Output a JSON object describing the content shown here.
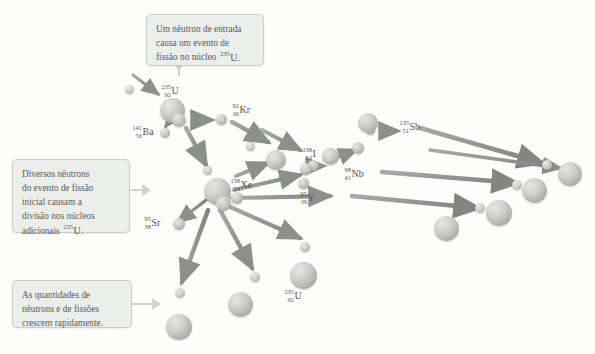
{
  "diagram": {
    "type": "nuclear-fission-chain-reaction",
    "palette": {
      "background": "#fdfdfc",
      "callout_fill": "#eceeec",
      "callout_border": "#c9cdc9",
      "text": "#5b5b57",
      "arrow": "#8d8f89",
      "sphere_light": "#e6e7e3",
      "sphere_dark": "#94968f"
    }
  },
  "callouts": [
    {
      "id": "callout-incoming-neutron",
      "lines": [
        "Um nêutron de entrada",
        "causa um evento de",
        "fissão no núcleo  235U."
      ],
      "line1": "Um nêutron de entrada",
      "line2": "causa um evento de",
      "line3_pre": "fissão no núcleo",
      "line3_iso_a": "235",
      "line3_iso_sym": "U."
    },
    {
      "id": "callout-several-neutrons",
      "lines": [
        "Diversos nêutrons",
        "do evento de fissão",
        "inicial causam a",
        "divisão nos núcleos",
        "adicionais  235U."
      ],
      "line1": "Diversos nêutrons",
      "line2": "do evento de fissão",
      "line3": "inicial causam a",
      "line4": "divisão nos núcleos",
      "line5_pre": "adicionais",
      "line5_iso_a": "235",
      "line5_iso_sym": "U."
    },
    {
      "id": "callout-rapid-growth",
      "lines": [
        "As quantidades de",
        "nêutrons e de fissões",
        "crescem rapidamente."
      ],
      "line1": "As quantidades de",
      "line2": "nêutrons e de fissões",
      "line3": "crescem rapidamente."
    }
  ],
  "isotopes": [
    {
      "id": "iso-u235-top",
      "a": "235",
      "z": "92",
      "symbol": "U"
    },
    {
      "id": "iso-kr92",
      "a": "92",
      "z": "36",
      "symbol": "Kr"
    },
    {
      "id": "iso-ba141",
      "a": "141",
      "z": "56",
      "symbol": "Ba"
    },
    {
      "id": "iso-sb135",
      "a": "135",
      "z": "51",
      "symbol": "Sb"
    },
    {
      "id": "iso-i138",
      "a": "138",
      "z": "53",
      "symbol": "I"
    },
    {
      "id": "iso-nb98",
      "a": "98",
      "z": "41",
      "symbol": "Nb"
    },
    {
      "id": "iso-xe138",
      "a": "138",
      "z": "54",
      "symbol": "Xe"
    },
    {
      "id": "iso-y95",
      "a": "95",
      "z": "39",
      "symbol": "Y"
    },
    {
      "id": "iso-sr95",
      "a": "95",
      "z": "38",
      "symbol": "Sr"
    },
    {
      "id": "iso-u235-bottom",
      "a": "235",
      "z": "92",
      "symbol": "U"
    }
  ]
}
